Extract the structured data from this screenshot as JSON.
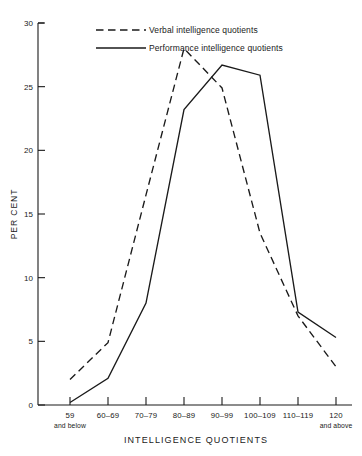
{
  "chart_data": {
    "type": "line",
    "title": "",
    "xlabel": "INTELLIGENCE QUOTIENTS",
    "ylabel": "PER CENT",
    "categories": [
      "59\nand below",
      "60-69",
      "70-79",
      "80-89",
      "90-99",
      "100-109",
      "110-119",
      "120\nand above"
    ],
    "category_labels": [
      {
        "main": "59",
        "sub": "and below"
      },
      {
        "main": "60–69",
        "sub": ""
      },
      {
        "main": "70–79",
        "sub": ""
      },
      {
        "main": "80–89",
        "sub": ""
      },
      {
        "main": "90–99",
        "sub": ""
      },
      {
        "main": "100–109",
        "sub": ""
      },
      {
        "main": "110–119",
        "sub": ""
      },
      {
        "main": "120",
        "sub": "and above"
      }
    ],
    "series": [
      {
        "name": "Verbal intelligence quotients",
        "style": "dashed",
        "color": "#1a1a1a",
        "values": [
          2.0,
          4.9,
          16.5,
          28.0,
          24.9,
          13.5,
          7.0,
          3.0
        ]
      },
      {
        "name": "Performance intelligence quotients",
        "style": "solid",
        "color": "#1a1a1a",
        "values": [
          0.2,
          2.1,
          8.0,
          23.2,
          26.7,
          25.9,
          7.3,
          5.3
        ]
      }
    ],
    "ylim": [
      0,
      30
    ],
    "yticks": [
      0,
      5,
      10,
      15,
      20,
      25,
      30
    ],
    "ytick_labels": [
      "0",
      "5",
      "10",
      "15",
      "20",
      "25",
      "30"
    ],
    "grid": false,
    "legend_position": "top-center"
  },
  "legend": {
    "items": [
      {
        "label": "Verbal intelligence quotients",
        "style": "dashed"
      },
      {
        "label": "Performance intelligence quotients",
        "style": "solid"
      }
    ]
  }
}
